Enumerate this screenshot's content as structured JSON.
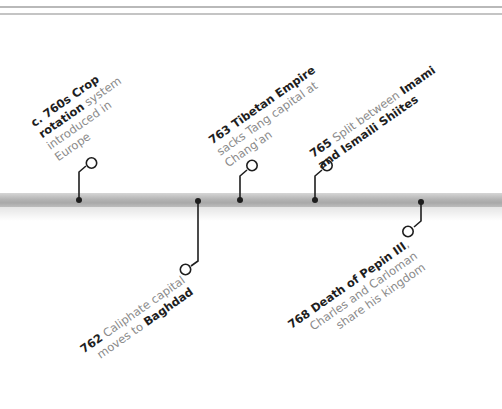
{
  "timeline": {
    "bar_color": "#b4b4b4",
    "marker_color": "#1e1e1e",
    "text_bold_color": "#1e1e1e",
    "text_regular_color": "#8a8a8a"
  },
  "events": [
    {
      "id": "760s",
      "position": "above",
      "year": "c. 760s",
      "lines": [
        {
          "bold": "c. 760s Crop",
          "regular": ""
        },
        {
          "bold": "rotation",
          "regular": " system"
        },
        {
          "bold": "",
          "regular": "introduced in"
        },
        {
          "bold": "",
          "regular": "Europe"
        }
      ]
    },
    {
      "id": "762",
      "position": "below",
      "year": "762",
      "lines": [
        {
          "bold": "762",
          "regular": " Caliphate capital"
        },
        {
          "regular": "moves to ",
          "bold": "Baghdad"
        }
      ]
    },
    {
      "id": "763",
      "position": "above",
      "year": "763",
      "lines": [
        {
          "bold": "763 Tibetan Empire",
          "regular": ""
        },
        {
          "bold": "",
          "regular": "sacks Tang capital at"
        },
        {
          "bold": "",
          "regular": "Chang'an"
        }
      ]
    },
    {
      "id": "765",
      "position": "above",
      "year": "765",
      "lines": [
        {
          "bold": "765",
          "regular": " Split between ",
          "bold2": "Imami"
        },
        {
          "bold": "and Ismaili Shiites",
          "regular": ""
        }
      ]
    },
    {
      "id": "768",
      "position": "below",
      "year": "768",
      "lines": [
        {
          "bold": "768 Death of Pepin III",
          "regular": ","
        },
        {
          "bold": "",
          "regular": "Charles and Carloman"
        },
        {
          "bold": "",
          "regular": "share his kingdom"
        }
      ]
    }
  ]
}
